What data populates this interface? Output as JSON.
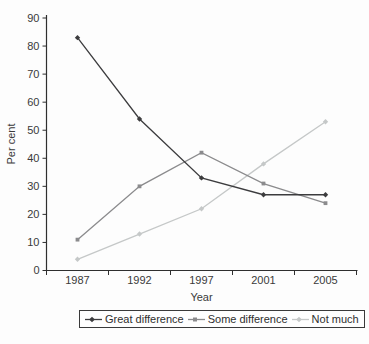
{
  "chart_data": {
    "type": "line",
    "title": "",
    "xlabel": "Year",
    "ylabel": "Per cent",
    "categories": [
      "1987",
      "1992",
      "1997",
      "2001",
      "2005"
    ],
    "series": [
      {
        "name": "Great difference",
        "values": [
          83,
          54,
          33,
          27,
          27
        ],
        "color": "#3c3c3e",
        "marker": "diamond"
      },
      {
        "name": "Some difference",
        "values": [
          11,
          30,
          42,
          31,
          24
        ],
        "color": "#8b8b8d",
        "marker": "square"
      },
      {
        "name": "Not much",
        "values": [
          4,
          13,
          22,
          38,
          53
        ],
        "color": "#c5c8c8",
        "marker": "diamond"
      }
    ],
    "ylim": [
      0,
      90
    ],
    "yticks": [
      0,
      10,
      20,
      30,
      40,
      50,
      60,
      70,
      80,
      90
    ],
    "grid": false,
    "legend_position": "bottom",
    "axis_color": "#2f2f2f",
    "text_color": "#3a3a3a",
    "tick_style": "between-categories"
  }
}
